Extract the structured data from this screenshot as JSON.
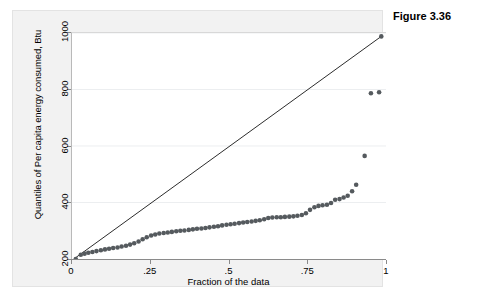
{
  "caption": "Figure 3.36",
  "chart_data": {
    "type": "scatter",
    "title": "",
    "subtitle": "",
    "xlabel": "Fraction of the data",
    "ylabel": "Quantiles of Per capita energy consumed, Btu",
    "xlim": [
      0,
      1
    ],
    "ylim": [
      200,
      1000
    ],
    "xticks": [
      0,
      0.25,
      0.5,
      0.75,
      1
    ],
    "xtick_labels": [
      "0",
      ".25",
      ".5",
      ".75",
      "1"
    ],
    "yticks": [
      200,
      400,
      600,
      800,
      1000
    ],
    "ytick_labels": [
      "200",
      "400",
      "600",
      "800",
      "1000"
    ],
    "grid": "horizontal",
    "legend": "none",
    "marker_color": "#555a5e",
    "line_color": "#2b2b2b",
    "background_color": "#f2f2f2",
    "plot_background_color": "#ffffff",
    "reference_line": {
      "name": "diagonal reference line",
      "x": [
        0.012,
        0.985
      ],
      "y": [
        205,
        988
      ]
    },
    "series": [
      {
        "name": "Quantiles of Per capita energy consumed",
        "x": [
          0.012,
          0.028,
          0.04,
          0.052,
          0.065,
          0.078,
          0.092,
          0.105,
          0.118,
          0.131,
          0.145,
          0.158,
          0.172,
          0.185,
          0.198,
          0.212,
          0.225,
          0.238,
          0.252,
          0.265,
          0.278,
          0.292,
          0.305,
          0.318,
          0.332,
          0.345,
          0.358,
          0.372,
          0.385,
          0.398,
          0.412,
          0.425,
          0.438,
          0.452,
          0.465,
          0.478,
          0.492,
          0.505,
          0.518,
          0.532,
          0.545,
          0.558,
          0.572,
          0.585,
          0.598,
          0.612,
          0.625,
          0.638,
          0.652,
          0.665,
          0.678,
          0.692,
          0.705,
          0.718,
          0.732,
          0.745,
          0.758,
          0.772,
          0.785,
          0.798,
          0.812,
          0.825,
          0.838,
          0.852,
          0.865,
          0.878,
          0.892,
          0.905,
          0.932,
          0.952,
          0.978,
          0.985
        ],
        "y": [
          200,
          215,
          219,
          222,
          225,
          228,
          231,
          234,
          236,
          239,
          241,
          244,
          247,
          251,
          256,
          262,
          270,
          277,
          283,
          287,
          290,
          292,
          294,
          296,
          298,
          300,
          301,
          303,
          305,
          307,
          308,
          310,
          312,
          314,
          316,
          319,
          321,
          323,
          325,
          327,
          329,
          331,
          333,
          335,
          337,
          341,
          345,
          347,
          348,
          348,
          349,
          350,
          351,
          353,
          356,
          362,
          374,
          383,
          388,
          390,
          392,
          398,
          410,
          412,
          418,
          424,
          440,
          463,
          565,
          787,
          790,
          988
        ]
      }
    ]
  }
}
